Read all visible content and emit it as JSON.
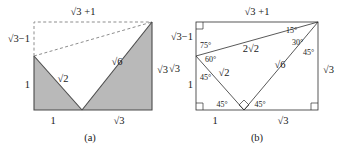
{
  "figure_a": {
    "caption": "(a)",
    "labels": {
      "top": "√3 +1",
      "left_upper": "√3−1",
      "left_lower": "1",
      "right": "√3",
      "bottom_left": "1",
      "bottom_right": "√3",
      "inner_left": "√2",
      "inner_right": "√6"
    }
  },
  "figure_b": {
    "caption": "(b)",
    "labels": {
      "top": "√3 +1",
      "left_upper": "√3−1",
      "left_outer": "√3",
      "left_lower": "1",
      "right": "√3",
      "bottom_left": "1",
      "bottom_right": "√3",
      "hyp_upper": "2√2",
      "inner_left": "√2",
      "inner_right": "√6"
    },
    "angles": {
      "left_75": "75°",
      "left_60": "60°",
      "left_45": "45°",
      "top_15": "15°",
      "top_30": "30°",
      "top_45": "45°",
      "bottom_45_left": "45°",
      "bottom_45_right": "45°"
    }
  },
  "colors": {
    "shade": "#b9b9b9",
    "line": "#4a4a4a",
    "dashed": "#8d8d8d",
    "text": "#1a1a1a"
  }
}
